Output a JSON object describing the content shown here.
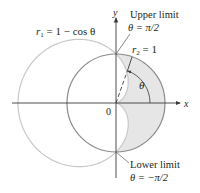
{
  "figure": {
    "type": "polar-region-diagram",
    "colors": {
      "background": "#ffffff",
      "axis": "#3a3a3a",
      "cardioid": "#c8c8c8",
      "circle": "#8a8a8a",
      "shaded_region": "#e6e6e6",
      "text": "#231f20"
    },
    "axes": {
      "x_label": "x",
      "y_label": "y",
      "origin_label": "0"
    },
    "curves": [
      {
        "id": "r1",
        "label_var": "r",
        "label_sub": "1",
        "label_rest": " = 1 − cos θ",
        "equation": "r1 = 1 - cos θ",
        "kind": "cardioid"
      },
      {
        "id": "r2",
        "label_var": "r",
        "label_sub": "2",
        "label_rest": " = 1",
        "equation": "r2 = 1",
        "kind": "circle"
      }
    ],
    "annotations": {
      "upper_limit_title": "Upper limit",
      "upper_limit_value": "θ = π/2",
      "lower_limit_title": "Lower limit",
      "lower_limit_value": "θ = −π/2",
      "angle_label": "θ"
    },
    "shaded_region": "inside r2 = 1 and outside r1 = 1 − cos θ, for −π/2 ≤ θ ≤ π/2"
  }
}
